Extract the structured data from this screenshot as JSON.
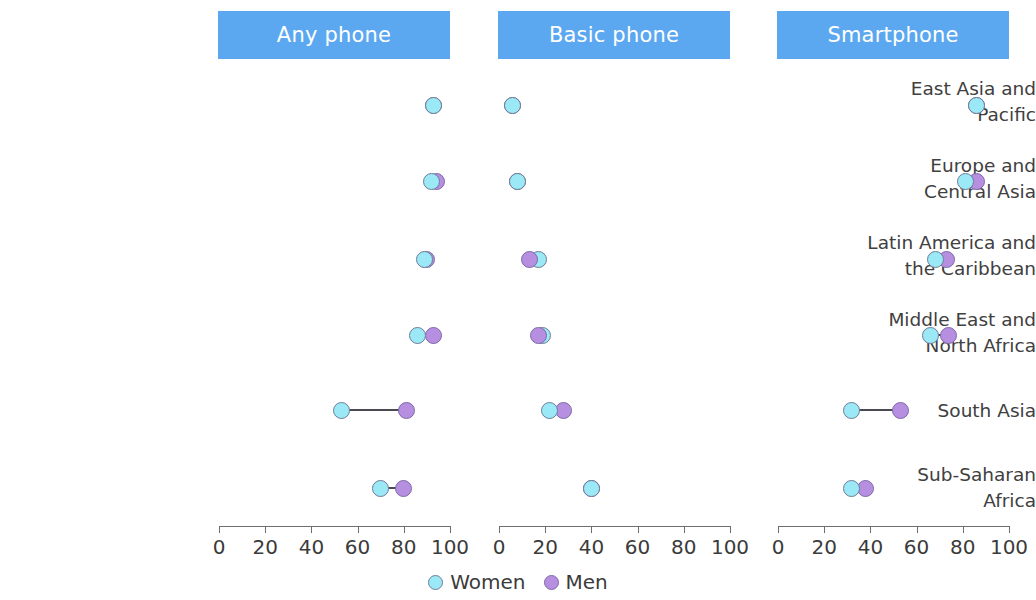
{
  "chart_data": {
    "type": "scatter",
    "title": "",
    "subtitle": "",
    "xlabel": "",
    "ylabel": "",
    "xlim": [
      0,
      100
    ],
    "xticks": [
      0,
      20,
      40,
      60,
      80,
      100
    ],
    "grid": false,
    "legend_position": "bottom-center",
    "panels": [
      {
        "label": "Any phone"
      },
      {
        "label": "Basic phone"
      },
      {
        "label": "Smartphone"
      }
    ],
    "categories": [
      "East Asia and\nPacific",
      "Europe and\nCentral Asia",
      "Latin America and\nthe Caribbean",
      "Middle East and\nNorth Africa",
      "South Asia",
      "Sub-Saharan\nAfrica"
    ],
    "legend": [
      {
        "name": "Women",
        "color": "#9be8f7"
      },
      {
        "name": "Men",
        "color": "#b68fe0"
      }
    ],
    "series": [
      {
        "name": "Women",
        "color": "#9be8f7",
        "panels": [
          {
            "panel": "Any phone",
            "values": [
              93,
              92,
              89,
              86,
              53,
              70
            ]
          },
          {
            "panel": "Basic phone",
            "values": [
              6,
              8,
              17,
              19,
              22,
              40
            ]
          },
          {
            "panel": "Smartphone",
            "values": [
              86,
              81,
              68,
              66,
              32,
              32
            ]
          }
        ]
      },
      {
        "name": "Men",
        "color": "#b68fe0",
        "panels": [
          {
            "panel": "Any phone",
            "values": [
              93,
              94,
              90,
              93,
              81,
              80
            ]
          },
          {
            "panel": "Basic phone",
            "values": [
              6,
              8,
              13,
              17,
              28,
              40
            ]
          },
          {
            "panel": "Smartphone",
            "values": [
              86,
              86,
              73,
              74,
              53,
              38
            ]
          }
        ]
      }
    ]
  },
  "colors": {
    "banner": "#5ca8f0",
    "banner_text": "#ffffff",
    "women": "#9be8f7",
    "men": "#b68fe0",
    "connector": "#4a4a55",
    "axis": "#6e6e6e",
    "text": "#3b3b3b"
  }
}
